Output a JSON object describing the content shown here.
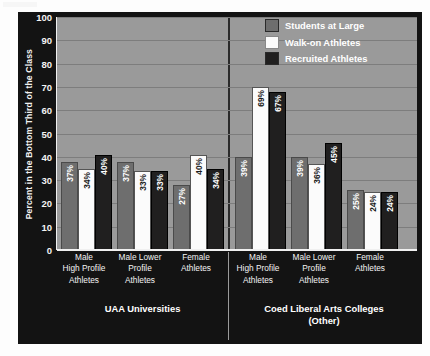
{
  "chart_data": {
    "type": "bar",
    "title": "",
    "xlabel": "",
    "ylabel": "Percent in the Bottom Third of the Class",
    "ylim": [
      0,
      100
    ],
    "yticks": [
      0,
      10,
      20,
      30,
      40,
      50,
      60,
      70,
      80,
      90,
      100
    ],
    "grid": true,
    "legend_position": "top-right",
    "categories": [
      "Male\nHigh Profile\nAthletes",
      "Male Lower\nProfile\nAthletes",
      "Female\nAthletes"
    ],
    "panels": [
      {
        "name": "UAA Universities",
        "series": [
          {
            "name": "Students at Large",
            "values": [
              37,
              37,
              27
            ]
          },
          {
            "name": "Walk-on Athletes",
            "values": [
              34,
              33,
              40
            ]
          },
          {
            "name": "Recruited Athletes",
            "values": [
              40,
              33,
              34
            ]
          }
        ]
      },
      {
        "name": "Coed Liberal Arts Colleges\n(Other)",
        "series": [
          {
            "name": "Students at Large",
            "values": [
              39,
              39,
              25
            ]
          },
          {
            "name": "Walk-on Athletes",
            "values": [
              69,
              36,
              24
            ]
          },
          {
            "name": "Recruited Athletes",
            "values": [
              67,
              45,
              24
            ]
          }
        ]
      }
    ],
    "series_colors": {
      "Students at Large": "#6e6e6e",
      "Walk-on Athletes": "#fbfbfb",
      "Recruited Athletes": "#201f1f"
    },
    "value_suffix": "%",
    "plot_background": "#9a9a9a",
    "frame_background": "#131313"
  },
  "axis": {
    "y_title": "Percent in the Bottom Third of the Class",
    "tick_labels": [
      "100",
      "90",
      "80",
      "70",
      "60",
      "50",
      "40",
      "30",
      "20",
      "10",
      "0"
    ]
  },
  "legend": {
    "items": [
      {
        "label": "Students at Large",
        "color": "#6e6e6e"
      },
      {
        "label": "Walk-on Athletes",
        "color": "#fbfbfb"
      },
      {
        "label": "Recruited Athletes",
        "color": "#201f1f"
      }
    ]
  },
  "categories_display": [
    {
      "line1": "Male",
      "line2": "High Profile",
      "line3": "Athletes"
    },
    {
      "line1": "Male Lower",
      "line2": "Profile",
      "line3": "Athletes"
    },
    {
      "line1": "Female",
      "line2": "Athletes",
      "line3": ""
    }
  ],
  "panel_titles": {
    "left": "UAA Universities",
    "right_line1": "Coed Liberal Arts Colleges",
    "right_line2": "(Other)"
  }
}
